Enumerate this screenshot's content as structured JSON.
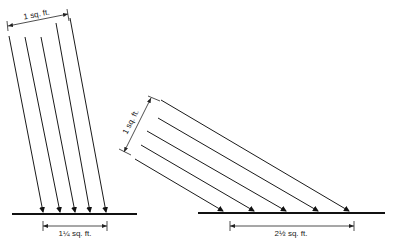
{
  "diagram": {
    "left_panel": {
      "beam_width_label": "1 sq. ft.",
      "ground_area_label": "1¼ sq. ft.",
      "ray_count": 5,
      "description": "Steep-angle rays spread over a small ground area"
    },
    "right_panel": {
      "beam_width_label": "1 sq. ft.",
      "ground_area_label": "2½ sq. ft.",
      "ray_count": 5,
      "description": "Low-angle rays spread over a larger ground area"
    },
    "colors": {
      "line": "#1a1a1a",
      "background": "#ffffff"
    }
  }
}
